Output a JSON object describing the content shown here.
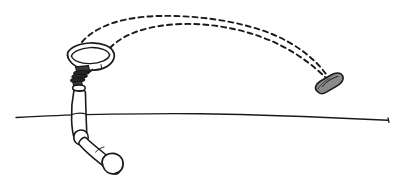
{
  "scene": {
    "title": "Robot arm tossing object trajectory sketch",
    "style": "hand-drawn line illustration",
    "width": 401,
    "height": 189,
    "background_color": "#ffffff",
    "ink_color": "#1a1a1a"
  },
  "elements": {
    "ground_line": {
      "name": "ground-line",
      "description": "wavy horizontal ground line sloping slightly downward to the right",
      "color": "#1a1a1a",
      "stroke_width": 1.3
    },
    "robot_arm": {
      "name": "robot-arm",
      "description": "articulated two-segment robotic arm with rounded base foot",
      "segment_count": 2,
      "fill_color": "#ffffff",
      "outline_color": "#1a1a1a"
    },
    "gripper": {
      "name": "robot-gripper",
      "description": "dark segmented gripper claw at top of arm holding the ring",
      "fill_color": "#3a3a3a"
    },
    "ring": {
      "name": "ring-hoop",
      "description": "elliptical ring or hoop rim held by the gripper",
      "fill_color": "#ffffff",
      "outline_color": "#1a1a1a"
    },
    "projectile": {
      "name": "projectile-capsule",
      "description": "gray filled capsule shaped object in mid air at right",
      "fill_color": "#8a8a8a",
      "outline_color": "#1a1a1a"
    },
    "trajectories": [
      {
        "name": "trajectory-arc-upper",
        "description": "upper dashed parabolic arc from ring area arcing right and descending toward the capsule",
        "dash_pattern": "5 4",
        "color": "#1a1a1a"
      },
      {
        "name": "trajectory-arc-lower",
        "description": "lower dashed parabolic arc running roughly parallel beneath the upper arc",
        "dash_pattern": "5 4",
        "color": "#1a1a1a"
      }
    ]
  }
}
